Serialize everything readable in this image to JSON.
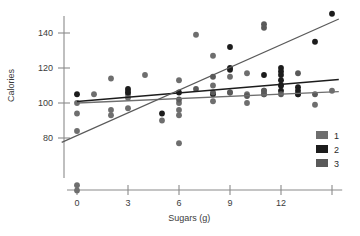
{
  "chart_data": {
    "type": "scatter",
    "title": "",
    "xlabel": "Sugars (g)",
    "ylabel": "Calories",
    "xlim": [
      -1.2,
      15.6
    ],
    "ylim": [
      45,
      155
    ],
    "grid": false,
    "legend_position": "bottom-right",
    "xticks": [
      0,
      3,
      6,
      9,
      12,
      15
    ],
    "xtick_labels": [
      "0",
      "3",
      "6",
      "9",
      "12",
      ""
    ],
    "yticks": [
      80,
      100,
      120,
      140
    ],
    "ytick_labels": [
      "80",
      "100",
      "120",
      "140"
    ],
    "legend": [
      {
        "name": "1",
        "label": "1",
        "color": "#6e6e6e"
      },
      {
        "name": "2",
        "label": "2",
        "color": "#1c1c1c"
      },
      {
        "name": "3",
        "label": "3",
        "color": "#5a5a5a"
      }
    ],
    "series": [
      {
        "name": "1",
        "color": "#6e6e6e",
        "marker": "circle",
        "points": [
          [
            0,
            94
          ],
          [
            0,
            84
          ],
          [
            0,
            100
          ],
          [
            0,
            53
          ],
          [
            0,
            50
          ],
          [
            1,
            105
          ],
          [
            2,
            114
          ],
          [
            2,
            96
          ],
          [
            2,
            93
          ],
          [
            3,
            107
          ],
          [
            3,
            105
          ],
          [
            3,
            103
          ],
          [
            3,
            97
          ],
          [
            4,
            116
          ],
          [
            5,
            90
          ],
          [
            6,
            113
          ],
          [
            6,
            100
          ],
          [
            6,
            96
          ],
          [
            6,
            93
          ],
          [
            6,
            77
          ],
          [
            7,
            139
          ],
          [
            8,
            127
          ],
          [
            8,
            110
          ],
          [
            8,
            101
          ],
          [
            9,
            115
          ],
          [
            9,
            106
          ],
          [
            10,
            117
          ],
          [
            10,
            105
          ],
          [
            10,
            100
          ],
          [
            11,
            107
          ],
          [
            11,
            105
          ],
          [
            12,
            110
          ],
          [
            13,
            105
          ],
          [
            14,
            99
          ],
          [
            15,
            107
          ]
        ]
      },
      {
        "name": "2",
        "color": "#1c1c1c",
        "marker": "circle",
        "points": [
          [
            0,
            105
          ],
          [
            3,
            108
          ],
          [
            3,
            106
          ],
          [
            5,
            94
          ],
          [
            6,
            106
          ],
          [
            8,
            105
          ],
          [
            9,
            132
          ],
          [
            9,
            120
          ],
          [
            9,
            119
          ],
          [
            11,
            116
          ],
          [
            12,
            120
          ],
          [
            12,
            118
          ],
          [
            12,
            116
          ],
          [
            12,
            113
          ],
          [
            12,
            110
          ],
          [
            12,
            107
          ],
          [
            13,
            109
          ],
          [
            13,
            107
          ],
          [
            13,
            105
          ],
          [
            14,
            135
          ],
          [
            15,
            151
          ]
        ]
      },
      {
        "name": "3",
        "color": "#5a5a5a",
        "marker": "circle",
        "points": [
          [
            6,
            102
          ],
          [
            7,
            108
          ],
          [
            8,
            115
          ],
          [
            8,
            106
          ],
          [
            9,
            106
          ],
          [
            10,
            104
          ],
          [
            11,
            107
          ],
          [
            11,
            105
          ],
          [
            12,
            105
          ],
          [
            11,
            145
          ],
          [
            11,
            143
          ],
          [
            13,
            117
          ],
          [
            14,
            105
          ]
        ]
      }
    ],
    "fit_lines": [
      {
        "name": "1",
        "color": "#6e6e6e",
        "x0": 0,
        "y0": 100.0,
        "x1": 15.4,
        "y1": 106.5,
        "width": 1.3
      },
      {
        "name": "2",
        "color": "#1c1c1c",
        "x0": 0,
        "y0": 100.8,
        "x1": 15.4,
        "y1": 113.5,
        "width": 1.5
      },
      {
        "name": "3",
        "color": "#5a5a5a",
        "x0": -0.9,
        "y0": 77.5,
        "x1": 15.4,
        "y1": 148.0,
        "width": 1.2
      }
    ]
  }
}
